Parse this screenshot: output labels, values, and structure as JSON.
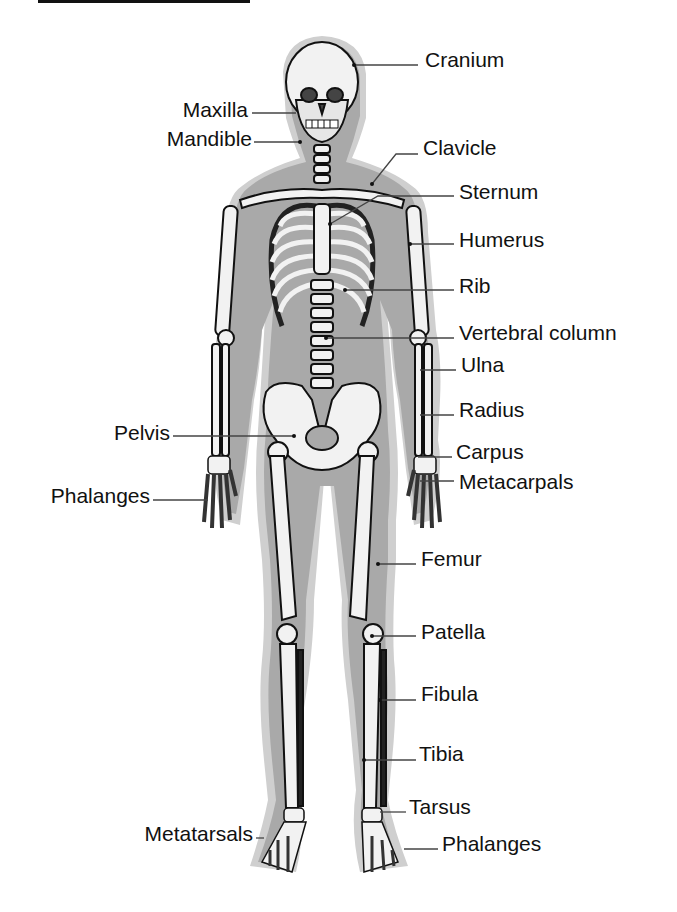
{
  "diagram": {
    "type": "labeled anatomy illustration",
    "colors": {
      "silhouette": "#a9a9a9",
      "silhouette_halo": "#cfcfcf",
      "bone": "#f2f2f2",
      "bone_shadow": "#555555",
      "outline": "#111111",
      "leader_line": "#444444",
      "text": "#111111"
    }
  },
  "labels": {
    "right": [
      {
        "id": "cranium",
        "text": "Cranium"
      },
      {
        "id": "clavicle",
        "text": "Clavicle"
      },
      {
        "id": "sternum",
        "text": "Sternum"
      },
      {
        "id": "humerus",
        "text": "Humerus"
      },
      {
        "id": "rib",
        "text": "Rib"
      },
      {
        "id": "vertebral_column",
        "text": "Vertebral column"
      },
      {
        "id": "ulna",
        "text": "Ulna"
      },
      {
        "id": "radius",
        "text": "Radius"
      },
      {
        "id": "carpus",
        "text": "Carpus"
      },
      {
        "id": "metacarpals",
        "text": "Metacarpals"
      },
      {
        "id": "femur",
        "text": "Femur"
      },
      {
        "id": "patella",
        "text": "Patella"
      },
      {
        "id": "fibula",
        "text": "Fibula"
      },
      {
        "id": "tibia",
        "text": "Tibia"
      },
      {
        "id": "tarsus",
        "text": "Tarsus"
      },
      {
        "id": "phalanges_foot",
        "text": "Phalanges"
      }
    ],
    "left": [
      {
        "id": "maxilla",
        "text": "Maxilla"
      },
      {
        "id": "mandible",
        "text": "Mandible"
      },
      {
        "id": "pelvis",
        "text": "Pelvis"
      },
      {
        "id": "phalanges_hand",
        "text": "Phalanges"
      },
      {
        "id": "metatarsals",
        "text": "Metatarsals"
      }
    ]
  }
}
